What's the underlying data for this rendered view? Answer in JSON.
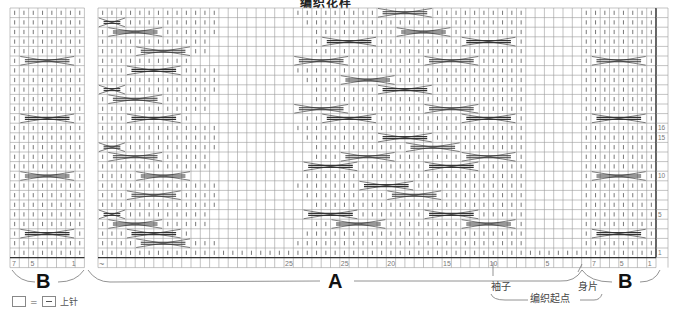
{
  "title": "编织花样",
  "grid": {
    "rows": 26,
    "row_height": 9.6,
    "top": 8,
    "cell_width": 9.3,
    "line_color": "#9a9a9a",
    "heavy_line_color": "#333333"
  },
  "left_block": {
    "label": "B",
    "x": 10,
    "cols": 8,
    "cables_rows": [
      5,
      11,
      17,
      23
    ],
    "numbers": [
      "7",
      "5",
      "1"
    ]
  },
  "main_block": {
    "x": 98,
    "cols": 60,
    "section_a_label": "A",
    "section_b_label": "B",
    "bottom_numbers": [
      {
        "col": 20,
        "text": "25"
      },
      {
        "col": 26,
        "text": "25"
      },
      {
        "col": 31,
        "text": "20"
      },
      {
        "col": 37,
        "text": "15"
      },
      {
        "col": 42,
        "text": "10"
      },
      {
        "col": 48,
        "text": "5"
      },
      {
        "col": 53,
        "text": "7"
      },
      {
        "col": 56,
        "text": "5"
      },
      {
        "col": 59,
        "text": "1"
      }
    ],
    "row_numbers": [
      {
        "row": 12,
        "text": "16"
      },
      {
        "row": 13,
        "text": "15"
      },
      {
        "row": 17,
        "text": "10"
      },
      {
        "row": 21,
        "text": "5"
      },
      {
        "row": 25,
        "text": "1"
      }
    ],
    "tilde": "~"
  },
  "annotations": {
    "sleeve": "袖子",
    "body": "身片",
    "start_point": "编织起点"
  },
  "legend": {
    "equals": "=",
    "label": "上针"
  }
}
